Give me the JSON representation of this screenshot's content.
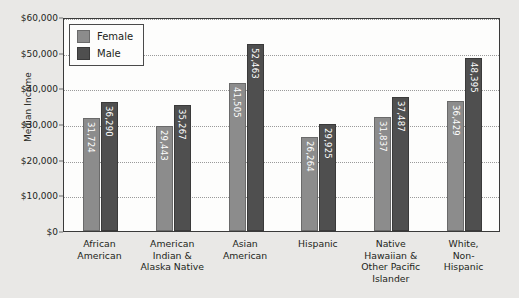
{
  "chart_data": {
    "type": "bar",
    "title": "",
    "subtitle": "",
    "xlabel": "",
    "ylabel": "Median Income",
    "ylim": [
      0,
      60000
    ],
    "grid": true,
    "legend_position": "top-left",
    "ytick_labels": [
      "$60,000",
      "$50,000",
      "$40,000",
      "$30,000",
      "$20,000",
      "$10,000",
      "$0"
    ],
    "ytick_values": [
      60000,
      50000,
      40000,
      30000,
      20000,
      10000,
      0
    ],
    "categories": [
      "African American",
      "American Indian & Alaska Native",
      "Asian American",
      "Hispanic",
      "Native Hawaiian & Other Pacific Islander",
      "White, Non-Hispanic"
    ],
    "category_lines": [
      [
        "African",
        "American"
      ],
      [
        "American",
        "Indian &",
        "Alaska Native"
      ],
      [
        "Asian",
        "American"
      ],
      [
        "Hispanic"
      ],
      [
        "Native",
        "Hawaiian &",
        "Other Pacific",
        "Islander"
      ],
      [
        "White,",
        "Non-",
        "Hispanic"
      ]
    ],
    "series": [
      {
        "name": "Female",
        "color": "#8c8c8c",
        "values": [
          31724,
          29443,
          41505,
          26264,
          31837,
          36429
        ],
        "labels": [
          "31,724",
          "29,443",
          "41,505",
          "26,264",
          "31,837",
          "36,429"
        ]
      },
      {
        "name": "Male",
        "color": "#4f4f4f",
        "values": [
          36290,
          35267,
          52463,
          29925,
          37487,
          48395
        ],
        "labels": [
          "36,290",
          "35,267",
          "52,463",
          "29,925",
          "37,487",
          "48,395"
        ]
      }
    ]
  },
  "legend": {
    "items": [
      {
        "label": "Female",
        "color": "#8c8c8c"
      },
      {
        "label": "Male",
        "color": "#4f4f4f"
      }
    ]
  },
  "colors": {
    "background": "#e9e8e6",
    "plot_background": "#fdfdfc",
    "axis": "#3a3a3a",
    "gridline": "#9a9a9a",
    "text": "#231f20",
    "female_bar": "#8c8c8c",
    "male_bar": "#4f4f4f"
  }
}
